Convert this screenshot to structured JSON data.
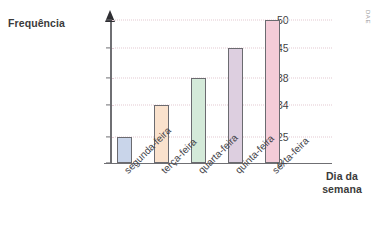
{
  "chart_data": {
    "type": "bar",
    "title": "",
    "xlabel": "Dia da semana",
    "ylabel": "Frequência",
    "categories": [
      "segunda-feira",
      "terça-feira",
      "quarta-feira",
      "quinta-feira",
      "sexta-feira"
    ],
    "values": [
      25,
      34,
      38,
      45,
      50
    ],
    "yticks": [
      0,
      25,
      34,
      38,
      45,
      50
    ],
    "ytick_labels": [
      "0",
      "25",
      "34",
      "38",
      "45",
      "50"
    ],
    "ylim": [
      0,
      50
    ],
    "grid": true,
    "grid_style": "dotted",
    "legend": "none",
    "bar_colors": [
      "#c9d5ea",
      "#fae2cd",
      "#d4ead9",
      "#ddcfe0",
      "#f4ccd8"
    ],
    "bar_border_color": "#6b6b70",
    "axis_color": "#6f6f73",
    "gridline_color": "#e3c9d2",
    "text_color": "#3b3b3b"
  },
  "labels": {
    "y_axis_title": "Frequência",
    "x_axis_title": "Dia da semana"
  },
  "watermark": {
    "text": "DAE"
  }
}
